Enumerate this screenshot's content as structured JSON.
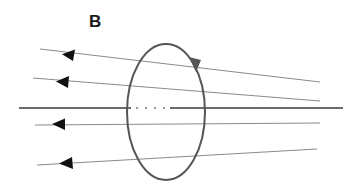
{
  "diagram": {
    "label": "B",
    "colors": {
      "field_line": "#8a8a8a",
      "axis": "#3a3a3a",
      "loop": "#555555",
      "arrow": "#111111"
    },
    "field_lines": [
      {
        "x1": 320,
        "y1": 82,
        "x2": 40,
        "y2": 49,
        "arrow_at": [
          68,
          55
        ]
      },
      {
        "x1": 320,
        "y1": 101,
        "x2": 33,
        "y2": 78,
        "arrow_at": [
          62,
          82
        ]
      },
      {
        "x1": 320,
        "y1": 123,
        "x2": 35,
        "y2": 125,
        "arrow_at": [
          58,
          124
        ]
      },
      {
        "x1": 317,
        "y1": 149,
        "x2": 37,
        "y2": 165,
        "arrow_at": [
          65,
          163
        ]
      }
    ],
    "axis": {
      "x1": 19,
      "y1": 108,
      "x2": 343,
      "y2": 108,
      "dotted_from": 131,
      "dotted_to": 170
    },
    "loop": {
      "cx": 166,
      "cy": 112,
      "rx": 39,
      "ry": 68,
      "direction": "clockwise"
    }
  }
}
